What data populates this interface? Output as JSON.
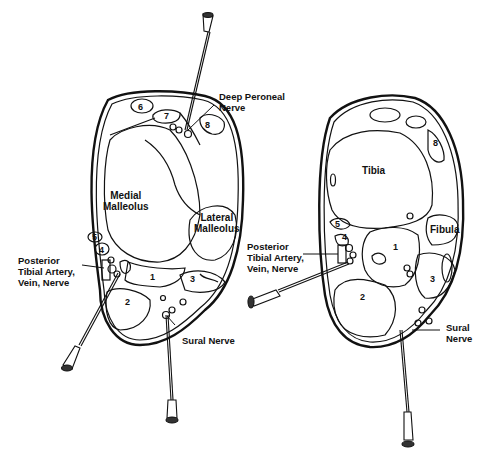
{
  "figure": {
    "left_panel": {
      "labels": {
        "deep_peroneal": "Deep Peroneal\nNerve",
        "medial_malleolus": "Medial\nMalleolus",
        "lateral_malleolus": "Lateral\nMalleolus",
        "posterior_tibial": "Posterior\nTibial Artery,\nVein, Nerve",
        "sural": "Sural Nerve"
      },
      "numbers": [
        "1",
        "2",
        "3",
        "4",
        "5",
        "6",
        "7",
        "8"
      ]
    },
    "right_panel": {
      "labels": {
        "tibia": "Tibia",
        "fibula": "Fibula",
        "posterior_tibial": "Posterior\nTibial Artery,\nVein, Nerve",
        "sural": "Sural\nNerve"
      },
      "numbers": [
        "1",
        "2",
        "3",
        "4",
        "5",
        "8"
      ]
    },
    "colors": {
      "line": "#111111",
      "background": "#ffffff"
    }
  }
}
